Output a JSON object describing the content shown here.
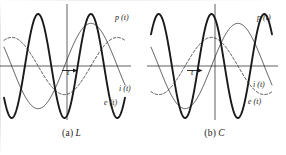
{
  "figure": {
    "background_color": "#ffffff",
    "ink_color": "#1a1a1a"
  },
  "panels": [
    {
      "id": "a",
      "caption_tag": "(a)",
      "caption_symbol": "L",
      "axis_label_t": "t",
      "labels": {
        "p": "p (t)",
        "i": "i (t)",
        "e": "e (t)"
      }
    },
    {
      "id": "b",
      "caption_tag": "(b)",
      "caption_symbol": "C",
      "axis_label_t": "t",
      "labels": {
        "p": "p (t)",
        "i": "i (t)",
        "e": "e (t)"
      }
    }
  ],
  "chart_data": [
    {
      "type": "line",
      "title": "(a) L",
      "xlabel": "t",
      "ylabel": "",
      "xlim": [
        -3.6,
        3.6
      ],
      "ylim": [
        -1.15,
        1.15
      ],
      "grid": false,
      "legend": "inline-curve-labels",
      "x_axis_at_y": 0,
      "y_axis_at_x": 0,
      "series": [
        {
          "name": "e (t)",
          "label": "e (t)",
          "style": "solid-thin",
          "linewidth": 0.8,
          "amplitude": 0.82,
          "angular_frequency": 1.0,
          "phase_deg": 0,
          "form": "e(t) = E sin(wt)"
        },
        {
          "name": "i (t)",
          "label": "i (t)",
          "style": "dashed",
          "linewidth": 0.8,
          "amplitude": 0.55,
          "angular_frequency": 1.0,
          "phase_deg": -90,
          "form": "i(t) = I sin(wt - 90deg)  [current lags voltage]"
        },
        {
          "name": "p (t)",
          "label": "p (t)",
          "style": "solid-bold",
          "linewidth": 2.0,
          "amplitude": 1.0,
          "angular_frequency": 2.0,
          "phase_deg": -90,
          "form": "p(t) = -P sin(2wt)  [net energy zero over a cycle]"
        }
      ]
    },
    {
      "type": "line",
      "title": "(b) C",
      "xlabel": "t",
      "ylabel": "",
      "xlim": [
        -3.6,
        3.6
      ],
      "ylim": [
        -1.15,
        1.15
      ],
      "grid": false,
      "legend": "inline-curve-labels",
      "x_axis_at_y": 0,
      "y_axis_at_x": 0,
      "series": [
        {
          "name": "e (t)",
          "label": "e (t)",
          "style": "solid-thin",
          "linewidth": 0.8,
          "amplitude": 0.82,
          "angular_frequency": 1.0,
          "phase_deg": 0,
          "form": "e(t) = E sin(wt)"
        },
        {
          "name": "i (t)",
          "label": "i (t)",
          "style": "dashed",
          "linewidth": 0.8,
          "amplitude": 0.55,
          "angular_frequency": 1.0,
          "phase_deg": 90,
          "form": "i(t) = I sin(wt + 90deg)  [current leads voltage]"
        },
        {
          "name": "p (t)",
          "label": "p (t)",
          "style": "solid-bold",
          "linewidth": 2.0,
          "amplitude": 1.0,
          "angular_frequency": 2.0,
          "phase_deg": 90,
          "form": "p(t) = P sin(2wt)  [net energy zero over a cycle]"
        }
      ]
    }
  ]
}
